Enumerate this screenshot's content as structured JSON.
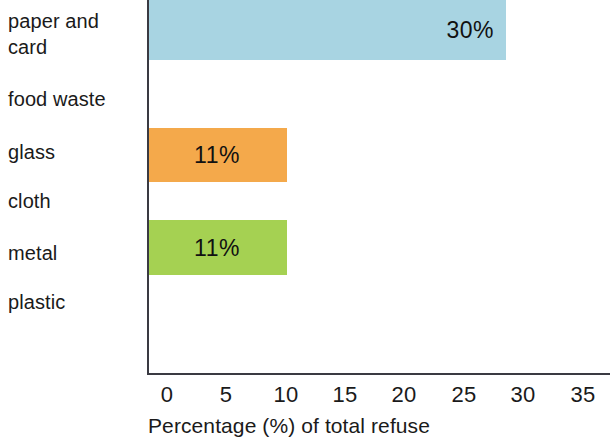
{
  "chart_data": {
    "type": "bar",
    "orientation": "horizontal",
    "title": "",
    "xlabel": "Percentage (%) of total refuse",
    "ylabel": "",
    "categories": [
      "paper and card",
      "food waste",
      "glass",
      "cloth",
      "metal",
      "plastic"
    ],
    "values": [
      30,
      null,
      11,
      null,
      11,
      null
    ],
    "value_labels": [
      "30%",
      "",
      "11%",
      "",
      "11%",
      ""
    ],
    "bar_colors": [
      "#a8d4e2",
      "",
      "#f4a94b",
      "",
      "#a5d152",
      ""
    ],
    "xlim": [
      0,
      35
    ],
    "xticks": [
      0,
      5,
      10,
      15,
      20,
      25,
      30,
      35
    ],
    "xtick_labels": [
      "0",
      "5",
      "10",
      "15",
      "20",
      "25",
      "30",
      "35"
    ],
    "grid": false,
    "legend": false
  },
  "axis": {
    "label": "Percentage (%) of total refuse",
    "ticks": [
      {
        "label": "0",
        "x": 167
      },
      {
        "label": "5",
        "x": 226
      },
      {
        "label": "10",
        "x": 286
      },
      {
        "label": "15",
        "x": 345
      },
      {
        "label": "20",
        "x": 404
      },
      {
        "label": "25",
        "x": 464
      },
      {
        "label": "30",
        "x": 523
      },
      {
        "label": "35",
        "x": 583
      }
    ]
  },
  "categories": [
    {
      "name": "paper and card",
      "label": "paper and\ncard",
      "label_top": 8,
      "bar": {
        "top": 0,
        "height": 60,
        "width": 359,
        "color": "#a8d4e2",
        "value_label": "30%",
        "label_pos": "end"
      }
    },
    {
      "name": "food waste",
      "label": "food waste",
      "label_top": 86,
      "bar": null
    },
    {
      "name": "glass",
      "label": "glass",
      "label_top": 139,
      "bar": {
        "top": 128,
        "height": 54,
        "width": 140,
        "color": "#f4a94b",
        "value_label": "11%",
        "label_pos": "center"
      }
    },
    {
      "name": "cloth",
      "label": "cloth",
      "label_top": 188,
      "bar": null
    },
    {
      "name": "metal",
      "label": "metal",
      "label_top": 240,
      "bar": {
        "top": 220,
        "height": 55,
        "width": 140,
        "color": "#a5d152",
        "value_label": "11%",
        "label_pos": "center"
      }
    },
    {
      "name": "plastic",
      "label": "plastic",
      "label_top": 289,
      "bar": null
    }
  ]
}
